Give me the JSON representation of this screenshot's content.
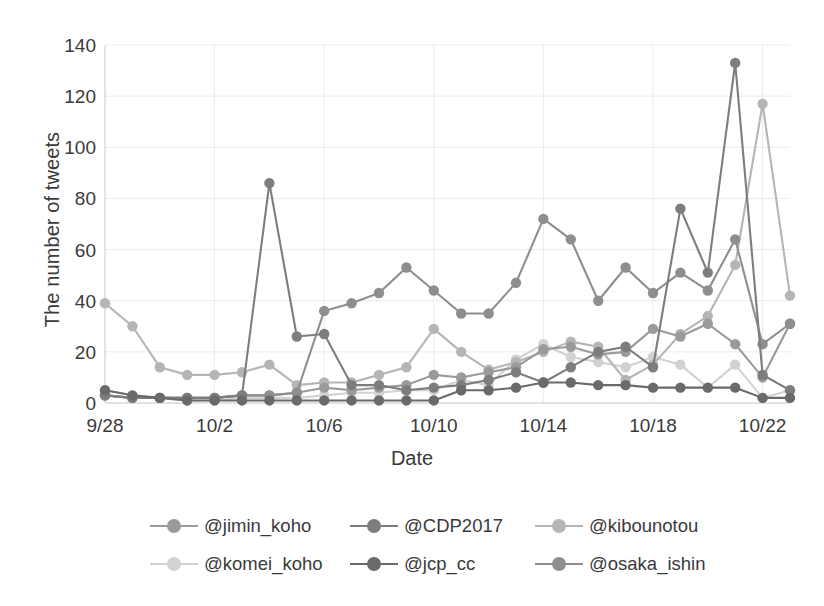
{
  "chart_data": {
    "type": "line",
    "title": "",
    "xlabel": "Date",
    "ylabel": "The number of tweets",
    "ylim": [
      0,
      140
    ],
    "ytick_step": 20,
    "yticks": [
      0,
      20,
      40,
      60,
      80,
      100,
      120,
      140
    ],
    "grid": true,
    "legend_position": "bottom",
    "x": [
      "9/28",
      "9/29",
      "9/30",
      "10/1",
      "10/2",
      "10/3",
      "10/4",
      "10/5",
      "10/6",
      "10/7",
      "10/8",
      "10/9",
      "10/10",
      "10/11",
      "10/12",
      "10/13",
      "10/14",
      "10/15",
      "10/16",
      "10/17",
      "10/18",
      "10/19",
      "10/20",
      "10/21",
      "10/22",
      "10/23"
    ],
    "xtick_labels": [
      "9/28",
      "10/2",
      "10/6",
      "10/10",
      "10/14",
      "10/18",
      "10/22"
    ],
    "xtick_indices": [
      0,
      4,
      8,
      12,
      16,
      20,
      24
    ],
    "categories": [
      "9/28",
      "9/29",
      "9/30",
      "10/1",
      "10/2",
      "10/3",
      "10/4",
      "10/5",
      "10/6",
      "10/7",
      "10/8",
      "10/9",
      "10/10",
      "10/11",
      "10/12",
      "10/13",
      "10/14",
      "10/15",
      "10/16",
      "10/17",
      "10/18",
      "10/19",
      "10/20",
      "10/21",
      "10/22",
      "10/23"
    ],
    "series": [
      {
        "name": "@jimin_koho",
        "color": "#9a9a9a",
        "values": [
          3,
          2,
          2,
          2,
          2,
          3,
          3,
          4,
          6,
          5,
          6,
          7,
          11,
          10,
          12,
          14,
          21,
          22,
          19,
          20,
          29,
          26,
          31,
          23,
          10,
          31
        ]
      },
      {
        "name": "@CDP2017",
        "color": "#7d7d7d",
        "values": [
          3,
          2,
          2,
          2,
          2,
          3,
          86,
          26,
          27,
          7,
          7,
          5,
          6,
          7,
          9,
          12,
          8,
          14,
          20,
          22,
          14,
          76,
          51,
          133,
          11,
          5
        ]
      },
      {
        "name": "@kibounotou",
        "color": "#b5b5b5",
        "values": [
          39,
          30,
          14,
          11,
          11,
          12,
          15,
          7,
          8,
          8,
          11,
          14,
          29,
          20,
          13,
          16,
          20,
          24,
          22,
          9,
          15,
          27,
          34,
          54,
          117,
          42
        ]
      },
      {
        "name": "@komei_koho",
        "color": "#d2d2d2",
        "values": [
          5,
          3,
          2,
          1,
          1,
          2,
          2,
          2,
          3,
          4,
          4,
          5,
          5,
          9,
          7,
          17,
          23,
          18,
          16,
          14,
          18,
          15,
          6,
          15,
          2,
          5
        ]
      },
      {
        "name": "@jcp_cc",
        "color": "#6a6a6a",
        "values": [
          5,
          3,
          2,
          1,
          1,
          1,
          1,
          1,
          1,
          1,
          1,
          1,
          1,
          5,
          5,
          6,
          8,
          8,
          7,
          7,
          6,
          6,
          6,
          6,
          2,
          2
        ]
      },
      {
        "name": "@osaka_ishin",
        "color": "#8e8e8e",
        "values": [
          3,
          2,
          2,
          2,
          2,
          3,
          3,
          4,
          36,
          39,
          43,
          53,
          44,
          35,
          35,
          47,
          72,
          64,
          40,
          53,
          43,
          51,
          44,
          64,
          23,
          31
        ]
      }
    ]
  },
  "axis": {
    "y_title": "The number of tweets",
    "x_title": "Date"
  },
  "legend": {
    "rows": [
      [
        {
          "label": "@jimin_koho",
          "color": "#9a9a9a",
          "left": 0
        },
        {
          "label": "@CDP2017",
          "color": "#7d7d7d",
          "left": 200
        },
        {
          "label": "@kibounotou",
          "color": "#b5b5b5",
          "left": 385
        }
      ],
      [
        {
          "label": "@komei_koho",
          "color": "#d2d2d2",
          "left": 0
        },
        {
          "label": "@jcp_cc",
          "color": "#6a6a6a",
          "left": 200
        },
        {
          "label": "@osaka_ishin",
          "color": "#8e8e8e",
          "left": 385
        }
      ]
    ]
  },
  "theme": {
    "background": "#ffffff",
    "text": "#3a3a3a",
    "grid": "#ebebeb",
    "axis_line": "#d8d8d8"
  }
}
